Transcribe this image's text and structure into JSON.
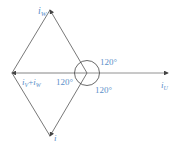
{
  "diagram": {
    "type": "phasor-diagram",
    "colors": {
      "line": "#555555",
      "label": "#5b8fc9"
    },
    "labels": {
      "i_w": {
        "base": "i",
        "sub": "W"
      },
      "i_u": {
        "base": "i",
        "sub": "U"
      },
      "i_v_plus_i_w": {
        "text1": "i",
        "sub1": "V",
        "plus": "+",
        "text2": "i",
        "sub2": "W"
      },
      "bottom": {
        "base": "i"
      }
    },
    "angles": {
      "upper_right": "120°",
      "left": "120°",
      "lower_right": "120°"
    }
  }
}
